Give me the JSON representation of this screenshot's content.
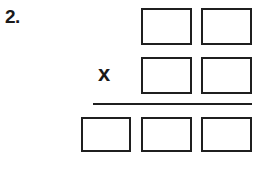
{
  "worksheet": {
    "problem_number": "2.",
    "operator": "x",
    "colors": {
      "ink": "#1f1f1f",
      "text": "#1a1a1a",
      "paper": "#ffffff"
    },
    "multiplicand": {
      "label": "multiplicand-row",
      "cells": [
        {
          "name": "multiplicand-tens",
          "value": ""
        },
        {
          "name": "multiplicand-ones",
          "value": ""
        }
      ]
    },
    "multiplier": {
      "label": "multiplier-row",
      "cells": [
        {
          "name": "multiplier-tens",
          "value": ""
        },
        {
          "name": "multiplier-ones",
          "value": ""
        }
      ]
    },
    "product": {
      "label": "product-row",
      "cells": [
        {
          "name": "product-hundreds",
          "value": ""
        },
        {
          "name": "product-tens",
          "value": ""
        },
        {
          "name": "product-ones",
          "value": ""
        }
      ]
    }
  }
}
